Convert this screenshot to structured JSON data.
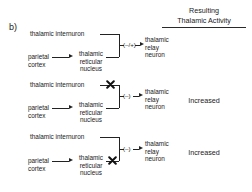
{
  "figure": {
    "panel_letter": "b)",
    "column_header_line1": "Resulting",
    "column_header_line2": "Thalamic Activity"
  },
  "nodes": {
    "internuron": "thalamic internuron",
    "cortex": "parietal\ncortex",
    "reticular": "thalamic\nreticular\nnucleus",
    "relay": "thalamic\nrelay\nneuron"
  },
  "panels": [
    {
      "id": "panel-1",
      "sign_label": "(–/+)",
      "result": "",
      "blocked": "none"
    },
    {
      "id": "panel-2",
      "sign_label": "(–)",
      "result": "Increased",
      "blocked": "internuron-pathway"
    },
    {
      "id": "panel-3",
      "sign_label": "(–)",
      "result": "Increased",
      "blocked": "reticular-pathway"
    }
  ],
  "colors": {
    "background": "#ffffff",
    "ink": "#1a1a1a",
    "line": "#222222"
  }
}
